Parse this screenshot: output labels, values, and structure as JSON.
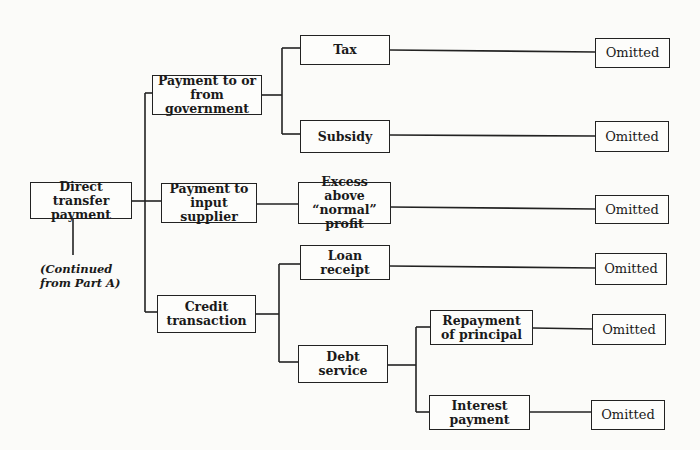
{
  "diagram": {
    "root": {
      "label": "Direct transfer\npayment"
    },
    "note": "(Continued\nfrom Part A)",
    "level1": [
      {
        "label": "Payment to or\nfrom government"
      },
      {
        "label": "Payment to\ninput supplier"
      },
      {
        "label": "Credit\ntransaction"
      }
    ],
    "level2": {
      "tax": "Tax",
      "subsidy": "Subsidy",
      "excess_profit": "Excess above\n“normal” profit",
      "loan_receipt": "Loan\nreceipt",
      "debt_service": "Debt\nservice"
    },
    "level3": {
      "repayment": "Repayment\nof principal",
      "interest": "Interest\npayment"
    },
    "outcome_label": "Omitted",
    "outcomes": [
      "Omitted",
      "Omitted",
      "Omitted",
      "Omitted",
      "Omitted",
      "Omitted"
    ]
  }
}
